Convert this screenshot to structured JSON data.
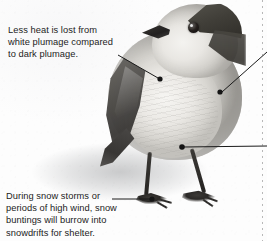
{
  "figure": {
    "annotations": [
      {
        "id": "plumage",
        "text": "Less heat is lost from\nwhite plumage compared\nto dark plumage.",
        "target": "white breast plumage"
      },
      {
        "id": "burrow",
        "text": "During snow storms or\nperiods of high wind, snow\nbuntings will burrow into\nsnowdrifts for shelter.",
        "target": "foot on snow"
      }
    ],
    "leader_color": "#1a1a1a",
    "text_color": "#1c1c1c",
    "background_color": "#fdfdfd",
    "offscreen_leaders": 2
  }
}
